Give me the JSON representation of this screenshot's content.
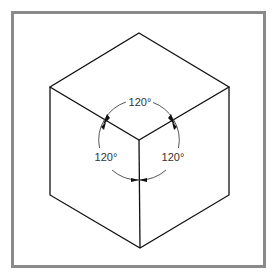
{
  "figure": {
    "type": "isometric-cube-diagram",
    "border_color": "#888888",
    "line_color": "#111111",
    "arc_color": "#444444",
    "angle_labels": [
      {
        "id": "top",
        "text": "120°"
      },
      {
        "id": "left",
        "text": "120°"
      },
      {
        "id": "right",
        "text": "120°"
      }
    ]
  }
}
